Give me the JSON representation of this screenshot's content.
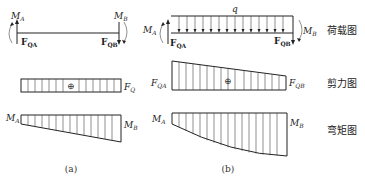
{
  "panels": {
    "a": {
      "caption": "(a)",
      "load": {
        "MA": "M",
        "MA_sub": "A",
        "MB": "M",
        "MB_sub": "B",
        "FQA": "F",
        "FQA_sub": "QA",
        "FQB": "F",
        "FQB_sub": "QB"
      },
      "shear": {
        "label": "F",
        "label_sub": "Q",
        "sign": "⊕"
      },
      "moment": {
        "MA": "M",
        "MA_sub": "A",
        "MB": "M",
        "MB_sub": "B"
      }
    },
    "b": {
      "caption": "(b)",
      "load": {
        "q": "q",
        "MA": "M",
        "MA_sub": "A",
        "MB": "M",
        "MB_sub": "B",
        "FQA": "F",
        "FQA_sub": "QA",
        "FQB": "F",
        "FQB_sub": "QB"
      },
      "shear": {
        "left": "F",
        "left_sub": "QA",
        "right": "F",
        "right_sub": "QB",
        "sign": "⊕"
      },
      "moment": {
        "MA": "M",
        "MA_sub": "A",
        "MB": "M",
        "MB_sub": "B"
      }
    }
  },
  "row_labels": {
    "load": "荷载图",
    "shear": "剪力图",
    "moment": "弯矩图"
  }
}
